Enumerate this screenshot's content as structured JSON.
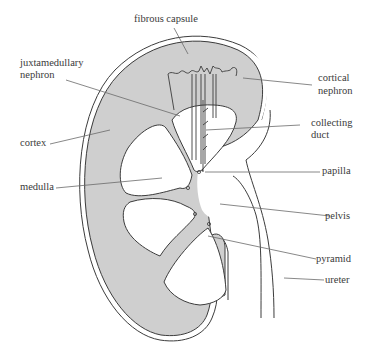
{
  "diagram": {
    "colors": {
      "tissue_fill": "#cfcfcf",
      "outline": "#3c3c3c",
      "leader_line": "#6a6a6a",
      "background": "#ffffff",
      "text": "#3a3a3a"
    },
    "labels": {
      "fibrous_capsule": "fibrous capsule",
      "juxtamedullary_nephron_1": "juxtamedullary",
      "juxtamedullary_nephron_2": "nephron",
      "cortical_nephron_1": "cortical",
      "cortical_nephron_2": "nephron",
      "collecting_duct_1": "collecting",
      "collecting_duct_2": "duct",
      "cortex": "cortex",
      "papilla": "papilla",
      "medulla": "medulla",
      "pelvis": "pelvis",
      "pyramid": "pyramid",
      "ureter": "ureter"
    }
  }
}
